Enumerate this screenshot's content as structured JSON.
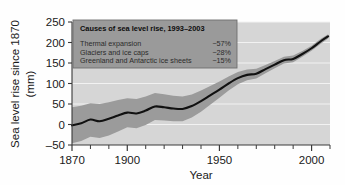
{
  "chart_data": {
    "type": "line",
    "title": "",
    "xlabel": "Year",
    "ylabel": "Sea level rise since 1870 (mm)",
    "ylabel_line1": "Sea level rise since 1870",
    "ylabel_line2": "(mm)",
    "xlim": [
      1870,
      2010
    ],
    "ylim": [
      -50,
      250
    ],
    "grid": true,
    "legend_position": "upper-left-inside",
    "x_ticks_major": [
      1870,
      1900,
      1950,
      2000
    ],
    "x_tick_labels": [
      "1870",
      "1900",
      "1950",
      "2000"
    ],
    "x_ticks_minor": [
      1880,
      1890,
      1910,
      1920,
      1930,
      1940,
      1960,
      1970,
      1980,
      1990,
      2010
    ],
    "y_ticks": [
      -50,
      0,
      50,
      100,
      150,
      200,
      250
    ],
    "y_tick_labels": [
      "‒50",
      "0",
      "50",
      "100",
      "150",
      "200",
      "250"
    ],
    "colors": {
      "plot_background": "#d6d6d6",
      "gridline": "#f2f2f2",
      "uncertainty_band": "#9b9b9b",
      "line": "#111111",
      "legend_background": "#9a9a9a",
      "legend_border": "#6f6f6f",
      "axis": "#3a3a3a",
      "page_background": "#fefefe"
    },
    "series": [
      {
        "name": "Sea level rise",
        "x": [
          1870,
          1875,
          1880,
          1885,
          1890,
          1895,
          1900,
          1905,
          1910,
          1915,
          1920,
          1925,
          1930,
          1935,
          1940,
          1945,
          1950,
          1955,
          1960,
          1965,
          1970,
          1975,
          1980,
          1985,
          1990,
          1995,
          2000,
          2005,
          2009
        ],
        "values": [
          -2,
          3,
          12,
          8,
          14,
          22,
          29,
          27,
          34,
          44,
          42,
          39,
          38,
          45,
          57,
          71,
          85,
          100,
          113,
          121,
          124,
          135,
          146,
          157,
          160,
          172,
          186,
          203,
          215
        ]
      }
    ],
    "uncertainty": {
      "name": "Uncertainty range",
      "x": [
        1870,
        1875,
        1880,
        1885,
        1890,
        1895,
        1900,
        1905,
        1910,
        1915,
        1920,
        1925,
        1930,
        1935,
        1940,
        1945,
        1950,
        1955,
        1960,
        1965,
        1970,
        1975,
        1980,
        1985,
        1990,
        1995,
        2000,
        2005,
        2009
      ],
      "upper": [
        42,
        46,
        52,
        50,
        54,
        60,
        64,
        62,
        68,
        77,
        74,
        70,
        68,
        73,
        83,
        94,
        105,
        117,
        128,
        134,
        136,
        145,
        155,
        165,
        168,
        179,
        192,
        209,
        220
      ],
      "lower": [
        -46,
        -40,
        -30,
        -33,
        -27,
        -17,
        -7,
        -9,
        -1,
        11,
        10,
        8,
        8,
        17,
        31,
        48,
        65,
        83,
        98,
        108,
        112,
        125,
        137,
        149,
        152,
        165,
        180,
        197,
        210
      ]
    },
    "legend_box": {
      "title": "Causes of sea level rise, 1993–2003",
      "rows": [
        {
          "label": "Thermal expansion",
          "value": "~57%"
        },
        {
          "label": "Glaciers and ice caps",
          "value": "~28%"
        },
        {
          "label": "Greenland and Antarctic ice sheets",
          "value": "~15%"
        }
      ]
    }
  }
}
